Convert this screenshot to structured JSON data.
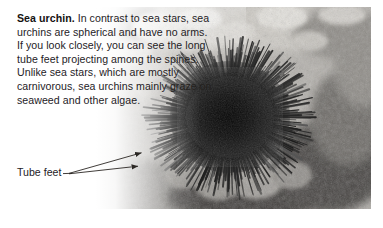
{
  "figure": {
    "kind": "textbook-photo-caption",
    "width": 383,
    "height": 228,
    "background_color": "#ffffff"
  },
  "caption": {
    "lead_in": "Sea urchin.",
    "body": " In contrast to sea stars, sea urchins are spherical and have no arms. If you look closely, you can see the long tube feet projecting among the spines. Unlike sea stars, which are mostly carnivorous, sea urchins mainly graze on seaweed and other algae.",
    "lines": [
      "Sea urchin. In contrast to sea stars,",
      "sea urchins are spherical and have",
      "no arms. If you look closely, you",
      "can see the long tube feet",
      "projecting among the spines.",
      "Unlike sea stars, which",
      "are mostly carnivorous,",
      "sea urchins mainly",
      "graze on seaweed",
      "and other algae."
    ],
    "text_color": "#25221f"
  },
  "annotation": {
    "label": "Tube feet",
    "leader_color": "#2b2724",
    "arrow_count": 2
  },
  "photo": {
    "subject": "sea urchin on coral reef",
    "alt": "Black sea urchin with long radiating spines resting on pale coral and algae-covered rock underwater",
    "edge_treatment": "soft faded left edge, hard right and bottom edges",
    "tones": {
      "urchin_core": "#0d0d0d",
      "spines": "#2a2a2a",
      "reef_light": "#d8d5cf",
      "reef_mid": "#9e9b95",
      "reef_dark": "#3d3b38",
      "water": "#b9b7b2"
    }
  }
}
